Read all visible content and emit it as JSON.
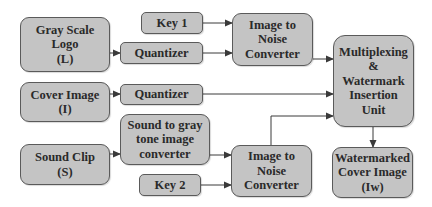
{
  "diagram": {
    "nodes": {
      "logo": {
        "lines": [
          "Gray Scale",
          "Logo",
          "(L)"
        ]
      },
      "key1": {
        "lines": [
          "Key 1"
        ]
      },
      "quant1": {
        "lines": [
          "Quantizer"
        ]
      },
      "itn1": {
        "lines": [
          "Image to",
          "Noise",
          "Converter"
        ]
      },
      "mux": {
        "lines": [
          "Multiplexing",
          "&",
          "Watermark",
          "Insertion",
          "Unit"
        ]
      },
      "cover": {
        "lines": [
          "Cover Image",
          "(I)"
        ]
      },
      "quant2": {
        "lines": [
          "Quantizer"
        ]
      },
      "sound": {
        "lines": [
          "Sound Clip",
          "(S)"
        ]
      },
      "s2g": {
        "lines": [
          "Sound to gray",
          "tone image",
          "converter"
        ]
      },
      "key2": {
        "lines": [
          "Key 2"
        ]
      },
      "itn2": {
        "lines": [
          "Image to",
          "Noise",
          "Converter"
        ]
      },
      "out": {
        "lines": [
          "Watermarked",
          "Cover Image",
          "(Iw)"
        ]
      }
    },
    "edges": [
      [
        "logo",
        "quant1"
      ],
      [
        "key1",
        "itn1"
      ],
      [
        "quant1",
        "itn1"
      ],
      [
        "itn1",
        "mux"
      ],
      [
        "cover",
        "quant2"
      ],
      [
        "quant2",
        "mux"
      ],
      [
        "sound",
        "s2g"
      ],
      [
        "s2g",
        "itn2"
      ],
      [
        "key2",
        "itn2"
      ],
      [
        "itn2",
        "mux"
      ],
      [
        "mux",
        "out"
      ]
    ],
    "colors": {
      "box_fill": "#c4c4c4",
      "box_border": "#5a5a5a",
      "line": "#3a3a3a",
      "text": "#2a2a2a"
    }
  }
}
